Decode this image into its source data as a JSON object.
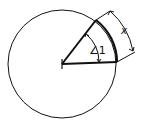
{
  "diagram": {
    "type": "circle-sector",
    "angle_label": "∠1",
    "arc_label": "x",
    "colors": {
      "stroke": "#111111",
      "background": "#ffffff"
    }
  }
}
